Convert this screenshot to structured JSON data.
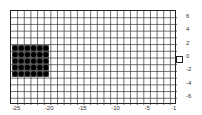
{
  "chart_data": {
    "type": "scatter",
    "title": "",
    "xlabel": "",
    "ylabel": "",
    "xlim": [
      -26,
      -1
    ],
    "ylim": [
      -7,
      7
    ],
    "grid": true,
    "x_ticks": [
      "-25",
      "-20",
      "-15",
      "-10",
      "-5",
      "-1"
    ],
    "y_ticks": [
      "6",
      "4",
      "2",
      "0",
      "-2",
      "-4",
      "-6"
    ],
    "y_axis_position": "right",
    "series": [
      {
        "name": "dots",
        "shape": "filled-circle",
        "color": "#000000",
        "points": [
          [
            -25,
            2
          ],
          [
            -24,
            2
          ],
          [
            -23,
            2
          ],
          [
            -22,
            2
          ],
          [
            -21,
            2
          ],
          [
            -20.5,
            2
          ],
          [
            -25,
            1
          ],
          [
            -24,
            1
          ],
          [
            -23,
            1
          ],
          [
            -22,
            1
          ],
          [
            -21,
            1
          ],
          [
            -20.5,
            1
          ],
          [
            -25,
            0
          ],
          [
            -24,
            0
          ],
          [
            -23,
            0
          ],
          [
            -22,
            0
          ],
          [
            -21,
            0
          ],
          [
            -20.5,
            0
          ],
          [
            -25,
            -1
          ],
          [
            -24,
            -1
          ],
          [
            -23,
            -1
          ],
          [
            -22,
            -1
          ],
          [
            -21,
            -1
          ],
          [
            -20.5,
            -1
          ],
          [
            -25,
            -2
          ],
          [
            -24,
            -2
          ],
          [
            -23,
            -2
          ],
          [
            -22,
            -2
          ],
          [
            -21,
            -2
          ],
          [
            -20.5,
            -2
          ]
        ],
        "grid_cols": 6,
        "grid_rows": 5
      }
    ],
    "annotations": [
      {
        "type": "marker-box",
        "label": "",
        "y": 0,
        "position": "right-edge"
      }
    ]
  }
}
